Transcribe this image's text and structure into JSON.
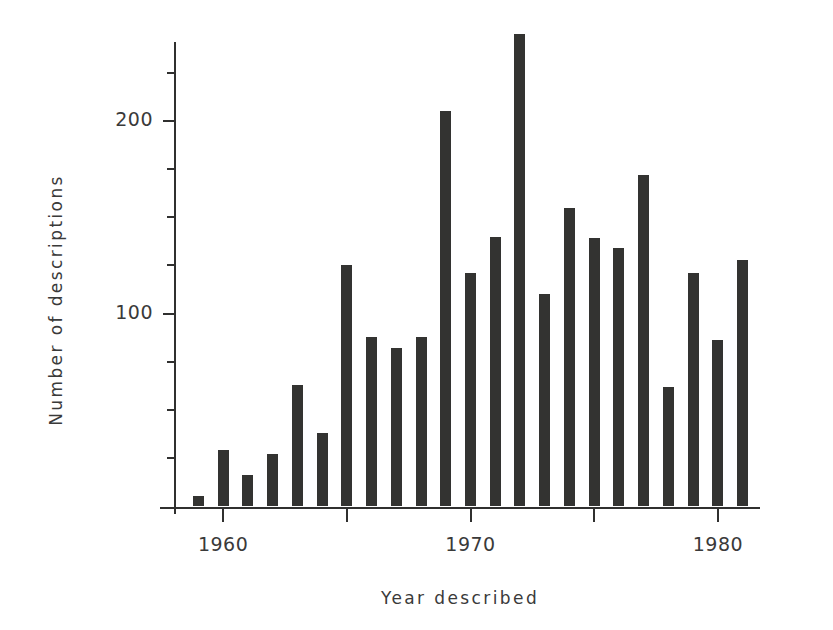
{
  "chart_data": {
    "type": "bar",
    "title": "",
    "xlabel": "Year described",
    "ylabel": "Number of descriptions",
    "categories": [
      1959,
      1960,
      1961,
      1962,
      1963,
      1964,
      1965,
      1966,
      1967,
      1968,
      1969,
      1970,
      1971,
      1972,
      1973,
      1974,
      1975,
      1976,
      1977,
      1978,
      1979,
      1980,
      1981
    ],
    "values": [
      5,
      29,
      16,
      27,
      63,
      38,
      125,
      88,
      82,
      88,
      205,
      121,
      140,
      245,
      110,
      155,
      139,
      134,
      172,
      62,
      121,
      86,
      128
    ],
    "xlim": [
      1958.3,
      1981.7
    ],
    "ylim": [
      0,
      252
    ],
    "xticks": [
      1960,
      1965,
      1970,
      1975,
      1980
    ],
    "xtick_labels": [
      "1960",
      "",
      "1970",
      "",
      "1980"
    ],
    "yticks": [
      100,
      200
    ],
    "ytick_labels": [
      "100",
      "200"
    ],
    "yticks_minor": [
      25,
      50,
      75,
      125,
      150,
      175,
      225
    ],
    "grid": false,
    "legend": null,
    "bar_color": "#333331"
  },
  "axes": {
    "ylabel_text": "Number of descriptions",
    "xlabel_text": "Year described",
    "ytick_200": "200",
    "ytick_100": "100",
    "xtick_1960": "1960",
    "xtick_1970": "1970",
    "xtick_1980": "1980"
  }
}
